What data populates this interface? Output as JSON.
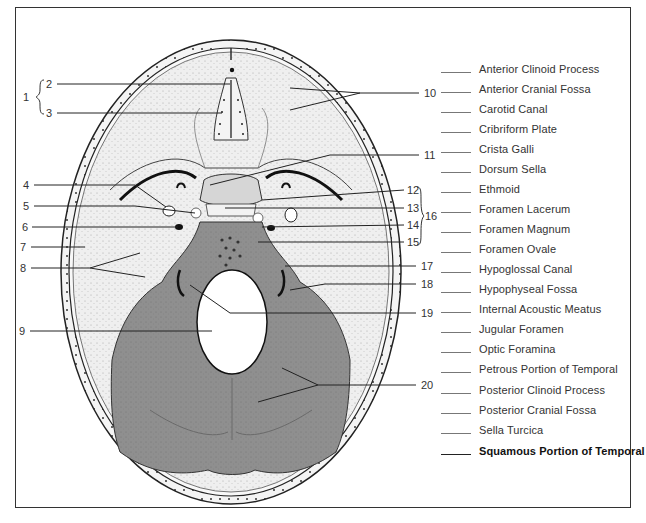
{
  "diagram": {
    "left_labels": [
      {
        "num": "1",
        "x": 23,
        "y": 91
      },
      {
        "num": "2",
        "x": 46,
        "y": 78
      },
      {
        "num": "3",
        "x": 46,
        "y": 107
      },
      {
        "num": "4",
        "x": 23,
        "y": 179
      },
      {
        "num": "5",
        "x": 23,
        "y": 200
      },
      {
        "num": "6",
        "x": 22,
        "y": 221
      },
      {
        "num": "7",
        "x": 20,
        "y": 241
      },
      {
        "num": "8",
        "x": 20,
        "y": 262
      },
      {
        "num": "9",
        "x": 19,
        "y": 325
      }
    ],
    "right_labels": [
      {
        "num": "10",
        "x": 424,
        "y": 87
      },
      {
        "num": "11",
        "x": 424,
        "y": 149
      },
      {
        "num": "12",
        "x": 407,
        "y": 184
      },
      {
        "num": "13",
        "x": 407,
        "y": 202
      },
      {
        "num": "14",
        "x": 407,
        "y": 219
      },
      {
        "num": "15",
        "x": 407,
        "y": 236
      },
      {
        "num": "16",
        "x": 425,
        "y": 210
      },
      {
        "num": "17",
        "x": 421,
        "y": 260
      },
      {
        "num": "18",
        "x": 421,
        "y": 278
      },
      {
        "num": "19",
        "x": 421,
        "y": 307
      },
      {
        "num": "20",
        "x": 421,
        "y": 379
      }
    ]
  },
  "word_bank": {
    "items": [
      {
        "label": "Anterior Clinoid Process",
        "bold": false
      },
      {
        "label": "Anterior Cranial Fossa",
        "bold": false
      },
      {
        "label": "Carotid Canal",
        "bold": false
      },
      {
        "label": "Cribriform Plate",
        "bold": false
      },
      {
        "label": "Crista Galli",
        "bold": false
      },
      {
        "label": "Dorsum Sella",
        "bold": false
      },
      {
        "label": "Ethmoid",
        "bold": false
      },
      {
        "label": "Foramen Lacerum",
        "bold": false
      },
      {
        "label": "Foramen Magnum",
        "bold": false
      },
      {
        "label": "Foramen Ovale",
        "bold": false
      },
      {
        "label": "Hypoglossal Canal",
        "bold": false
      },
      {
        "label": "Hypophyseal Fossa",
        "bold": false
      },
      {
        "label": "Internal Acoustic Meatus",
        "bold": false
      },
      {
        "label": "Jugular Foramen",
        "bold": false
      },
      {
        "label": "Optic Foramina",
        "bold": false
      },
      {
        "label": "Petrous Portion of Temporal",
        "bold": false
      },
      {
        "label": "Posterior Clinoid Process",
        "bold": false
      },
      {
        "label": "Posterior Cranial Fossa",
        "bold": false
      },
      {
        "label": "Sella Turcica",
        "bold": false
      },
      {
        "label": "Squamous Portion of Temporal",
        "bold": true
      }
    ]
  },
  "colors": {
    "bone_light": "#ededed",
    "bone_stipple": "#d8d8d8",
    "posterior_fossa": "#8e8e8e",
    "foramen_magnum": "#ffffff",
    "line": "#222222",
    "frame": "#333333"
  }
}
